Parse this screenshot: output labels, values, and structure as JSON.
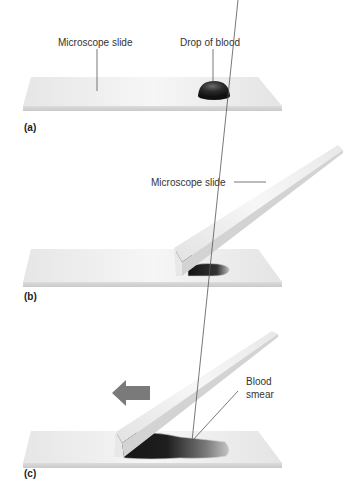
{
  "panels": [
    {
      "id": "a",
      "label": "(a)",
      "callouts": {
        "slide": "Microscope slide",
        "drop": "Drop of blood"
      }
    },
    {
      "id": "b",
      "label": "(b)",
      "callouts": {
        "slide": "Microscope slide"
      }
    },
    {
      "id": "c",
      "label": "(c)",
      "callouts": {
        "smear_line1": "Blood",
        "smear_line2": "smear"
      },
      "arrow_direction": "left"
    }
  ],
  "colors": {
    "slide_top": "#ececec",
    "slide_edge": "#d6d6d6",
    "blood": "#1e1e1e",
    "arrow": "#7a7a7a"
  }
}
